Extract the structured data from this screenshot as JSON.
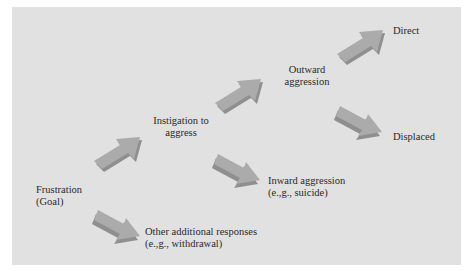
{
  "diagram": {
    "colors": {
      "background": "#e1e1e1",
      "arrow_face": "#a9a9a9",
      "arrow_shadow": "#8c8c8c",
      "text": "#2a2a2a"
    },
    "nodes": {
      "frustration": {
        "line1": "Frustration",
        "line2": "(Goal)"
      },
      "instigation": {
        "line1": "Instigation to",
        "line2": "aggress"
      },
      "other": {
        "line1": "Other additional responses",
        "line2": "(e.,g., withdrawal)"
      },
      "outward": {
        "line1": "Outward",
        "line2": "aggression"
      },
      "inward": {
        "line1": "Inward aggression",
        "line2": "(e.,g., suicide)"
      },
      "direct": {
        "line1": "Direct"
      },
      "displaced": {
        "line1": "Displaced"
      }
    },
    "edges": [
      {
        "from": "Frustration (Goal)",
        "to": "Instigation to aggress",
        "direction": "up-right"
      },
      {
        "from": "Frustration (Goal)",
        "to": "Other additional responses",
        "direction": "down-right"
      },
      {
        "from": "Instigation to aggress",
        "to": "Outward aggression",
        "direction": "up-right"
      },
      {
        "from": "Instigation to aggress",
        "to": "Inward aggression",
        "direction": "down-right"
      },
      {
        "from": "Outward aggression",
        "to": "Direct",
        "direction": "up-right"
      },
      {
        "from": "Outward aggression",
        "to": "Displaced",
        "direction": "down-right"
      }
    ]
  }
}
